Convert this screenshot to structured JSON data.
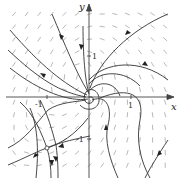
{
  "figure": {
    "type": "phase-portrait",
    "axes": {
      "x_label": "x",
      "y_label": "y",
      "x_ticks": [
        {
          "label": "-1",
          "value": -1
        },
        {
          "label": "1",
          "value": 1
        }
      ],
      "y_ticks": [
        {
          "label": "1",
          "value": 1
        },
        {
          "label": "-1",
          "value": -1
        }
      ],
      "range": {
        "x": [
          -2.1,
          2.1
        ],
        "y": [
          -2.1,
          2.1
        ]
      }
    },
    "equilibria": [
      {
        "kind": "spiral",
        "x": 0,
        "y": 0
      },
      {
        "kind": "saddle",
        "x": -1,
        "y": -1
      }
    ],
    "direction_field": {
      "grid": "13x13",
      "style": "short gray segments"
    },
    "colors": {
      "curves": "#333333",
      "field": "#9a9a9a",
      "axes": "#444444",
      "background": "#ffffff"
    }
  }
}
